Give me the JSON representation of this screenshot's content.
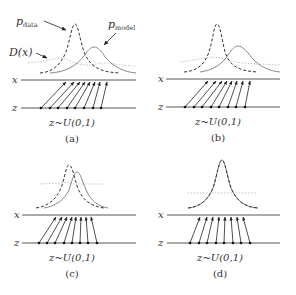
{
  "figure": {
    "panels": [
      {
        "id": "a",
        "caption": "(a)",
        "sampling_label": "z~U(0,1)",
        "axis_labels": {
          "x": "x",
          "z": "z"
        },
        "annotations": {
          "p_data": "p",
          "p_data_sub": "data",
          "p_model": "p",
          "p_model_sub": "model",
          "discriminator": "D(x)"
        }
      },
      {
        "id": "b",
        "caption": "(b)",
        "sampling_label": "z~U(0,1)",
        "axis_labels": {
          "x": "x",
          "z": "z"
        }
      },
      {
        "id": "c",
        "caption": "(c)",
        "sampling_label": "z~U(0,1)",
        "axis_labels": {
          "x": "x",
          "z": "z"
        }
      },
      {
        "id": "d",
        "caption": "(d)",
        "sampling_label": "z~U(0,1)",
        "axis_labels": {
          "x": "x",
          "z": "z"
        }
      }
    ],
    "legend": {
      "dashed_curve": "p_data (data distribution)",
      "solid_curve": "p_model (generator distribution)",
      "dotted_curve": "D(x) (discriminator output)"
    },
    "colors": {
      "data_curve": "#333333",
      "model_curve": "#777777",
      "discriminator_curve": "#bbbbbb",
      "axis": "#444444",
      "arrows": "#222222"
    }
  }
}
